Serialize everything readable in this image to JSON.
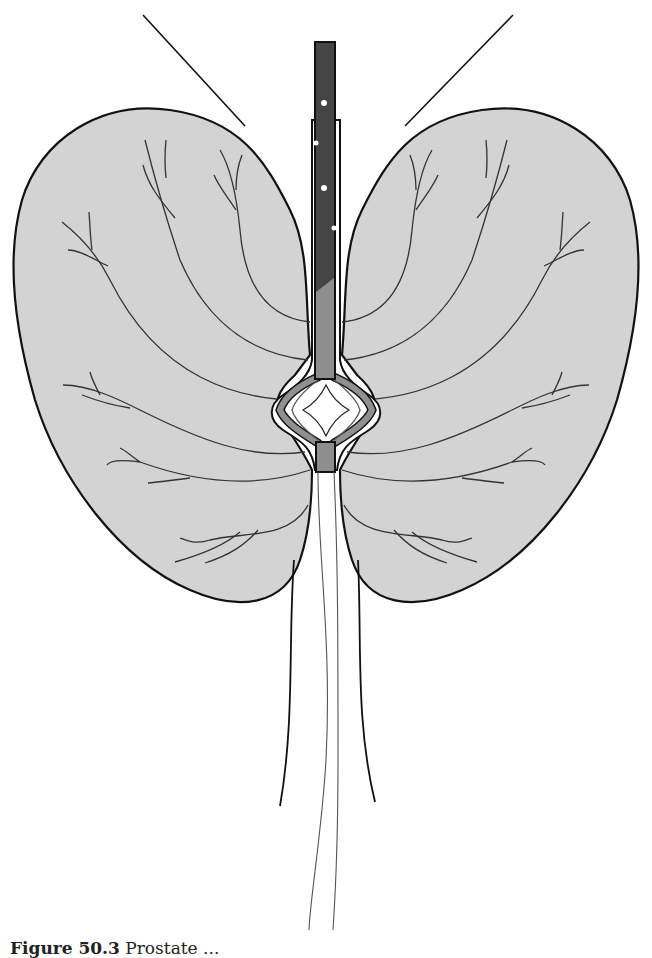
{
  "figure": {
    "caption_label": "Figure 50.3",
    "caption_text": "Prostate ...",
    "type": "anatomical illustration"
  },
  "colors": {
    "lobe_fill": "#d3d3d3",
    "outline": "#111111",
    "catheter_dark": "#454545",
    "catheter_light": "#8e8e8e",
    "ducts": "#333333",
    "background": "#ffffff"
  },
  "parts": {
    "left_lobe": "Left lobe",
    "right_lobe": "Right lobe",
    "catheter_shaft": "Catheter",
    "balloon": "Dilated urethral segment",
    "lower_segment": "Distal segment",
    "outer_strands": "Outer strands",
    "inner_strands": "Inner strands",
    "suspensory_lines": "Suspensory lines"
  }
}
